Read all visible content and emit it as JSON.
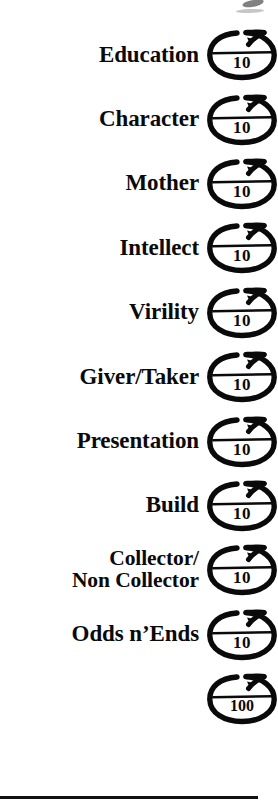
{
  "document": {
    "type": "scoring-checklist",
    "background_color": "#ffffff",
    "ink_color": "#0a0a0a"
  },
  "rows": [
    {
      "label": "Education",
      "denominator": "10",
      "icon": "circled-score-blank-icon"
    },
    {
      "label": "Character",
      "denominator": "10",
      "icon": "circled-score-blank-icon"
    },
    {
      "label": "Mother",
      "denominator": "10",
      "icon": "circled-score-blank-icon"
    },
    {
      "label": "Intellect",
      "denominator": "10",
      "icon": "circled-score-blank-icon"
    },
    {
      "label": "Virility",
      "denominator": "10",
      "icon": "circled-score-blank-icon"
    },
    {
      "label": "Giver/Taker",
      "denominator": "10",
      "icon": "circled-score-blank-icon"
    },
    {
      "label": "Presentation",
      "denominator": "10",
      "icon": "circled-score-blank-icon"
    },
    {
      "label": "Build",
      "denominator": "10",
      "icon": "circled-score-blank-icon"
    },
    {
      "label": "Collector/\nNon Collector",
      "denominator": "10",
      "icon": "circled-score-blank-icon"
    },
    {
      "label": "Odds n’Ends",
      "denominator": "10",
      "icon": "circled-score-blank-icon"
    },
    {
      "label": "",
      "denominator": "100",
      "icon": "circled-total-score-icon"
    }
  ],
  "footer": {
    "rule": ""
  }
}
